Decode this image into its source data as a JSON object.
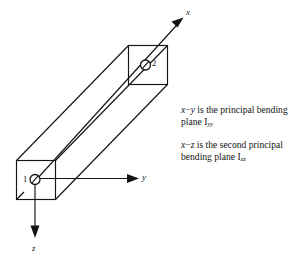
{
  "figure": {
    "type": "engineering-diagram",
    "background_color": "#ffffff",
    "line_color": "#141414"
  },
  "axes": [
    {
      "id": "x",
      "label": "x",
      "direction": "diagonal-up-right",
      "description": "beam longitudinal axis from node 1 through node 2"
    },
    {
      "id": "y",
      "label": "y",
      "direction": "right",
      "description": "horizontal transverse axis at node 1"
    },
    {
      "id": "z",
      "label": "z",
      "direction": "down",
      "description": "vertical transverse axis at node 1"
    }
  ],
  "nodes": [
    {
      "id": "1",
      "label": "1",
      "position": "near-end-cross-section-center",
      "label_side": "left"
    },
    {
      "id": "2",
      "label": "2",
      "position": "far-end-cross-section-center",
      "label_side": "right"
    }
  ],
  "captions": [
    {
      "id": "principal-bending-plane",
      "plane": "x − y",
      "text_prefix": "is the principal bending plane",
      "inertia_symbol": "I",
      "inertia_subscript": "yy",
      "lines": [
        "x − y is the principal",
        "bending plane I",
        "yy"
      ]
    },
    {
      "id": "second-principal-bending-plane",
      "plane": "x − z",
      "text_prefix": "is the second principal bending plane",
      "inertia_symbol": "I",
      "inertia_subscript": "zz",
      "lines": [
        "x − z is the second",
        "principal bending",
        "plane I",
        "zz"
      ]
    }
  ],
  "caption_text": {
    "p1_var_a": "x",
    "p1_dash": "−",
    "p1_var_b": "y",
    "p1_body": " is the principal bending plane ",
    "p1_inertia": "I",
    "p1_sub": "yy",
    "p2_var_a": "x",
    "p2_dash": "−",
    "p2_var_b": "z",
    "p2_body": " is the second principal bending plane ",
    "p2_inertia": "I",
    "p2_sub": "zz"
  },
  "axis_labels": {
    "x": "x",
    "y": "y",
    "z": "z"
  },
  "node_labels": {
    "n1": "1",
    "n2": "2"
  }
}
